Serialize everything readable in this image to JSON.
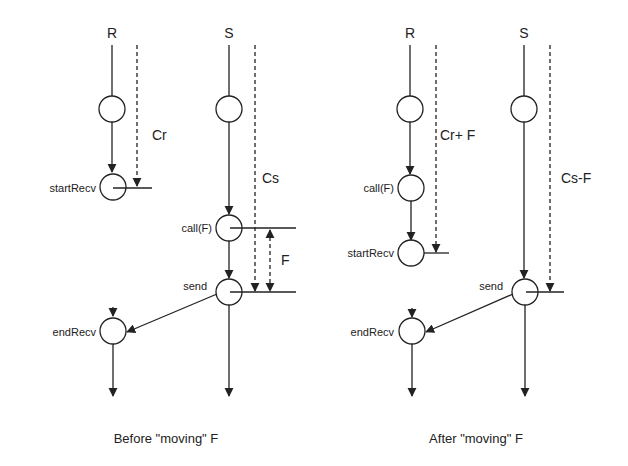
{
  "panels": [
    {
      "caption": "Before \"moving\" F",
      "processes": {
        "receiver": "R",
        "sender": "S"
      },
      "receiver_events": [
        "startRecv",
        "endRecv"
      ],
      "sender_events": [
        "call(F)",
        "send"
      ],
      "intervals": {
        "receiver": "Cr",
        "sender": "Cs",
        "moved": "F"
      }
    },
    {
      "caption": "After \"moving\" F",
      "processes": {
        "receiver": "R",
        "sender": "S"
      },
      "receiver_events": [
        "call(F)",
        "startRecv",
        "endRecv"
      ],
      "sender_events": [
        "send"
      ],
      "intervals": {
        "receiver": "Cr+ F",
        "sender": "Cs-F"
      }
    }
  ]
}
